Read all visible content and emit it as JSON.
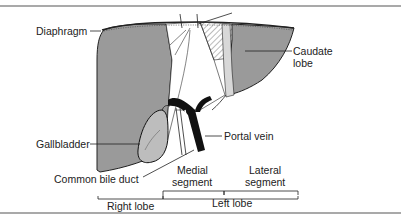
{
  "figure": {
    "labels": {
      "diaphragm": "Diaphragm",
      "caudate_line1": "Caudate",
      "caudate_line2": "lobe",
      "gallbladder": "Gallbladder",
      "portal_vein": "Portal vein",
      "common_bile_duct": "Common bile duct",
      "medial_line1": "Medial",
      "medial_line2": "segment",
      "lateral_line1": "Lateral",
      "lateral_line2": "segment",
      "right_lobe": "Right lobe",
      "left_lobe": "Left lobe"
    },
    "colors": {
      "liver_fill": "#9a9a9a",
      "liver_light": "#ffffff",
      "rule": "#555555",
      "ink": "#222222"
    }
  }
}
